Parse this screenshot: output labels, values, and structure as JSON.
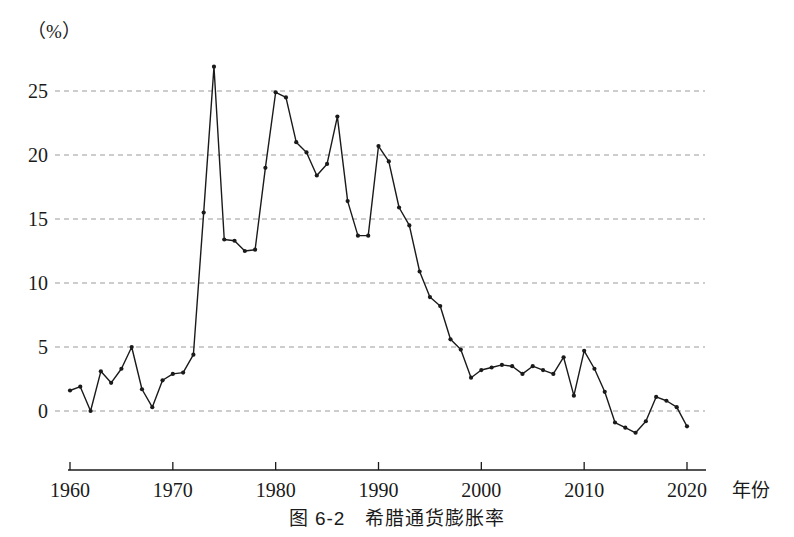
{
  "caption": "图 6-2　希腊通货膨胀率",
  "chart_data": {
    "type": "line",
    "title": "图 6-2　希腊通货膨胀率",
    "subtitle": "",
    "xlabel": "年份",
    "ylabel": "（%）",
    "unit_label": "（%）",
    "xlim": [
      1959,
      2021
    ],
    "ylim": [
      -2.5,
      28
    ],
    "grid": true,
    "grid_axis": "y",
    "legend": false,
    "legend_position": "none",
    "marker": "dot",
    "line_color": "#1a1a1a",
    "grid_color": "#9a9a9a",
    "axis_color": "#1a1a1a",
    "y_ticks": [
      0,
      5,
      10,
      15,
      20,
      25
    ],
    "y_tick_labels": [
      "0",
      "5",
      "10",
      "15",
      "20",
      "25"
    ],
    "x_ticks": [
      1960,
      1970,
      1980,
      1990,
      2000,
      2010,
      2020
    ],
    "x_tick_labels": [
      "1960",
      "1970",
      "1980",
      "1990",
      "2000",
      "2010",
      "2020"
    ],
    "x": [
      1960,
      1961,
      1962,
      1963,
      1964,
      1965,
      1966,
      1967,
      1968,
      1969,
      1970,
      1971,
      1972,
      1973,
      1974,
      1975,
      1976,
      1977,
      1978,
      1979,
      1980,
      1981,
      1982,
      1983,
      1984,
      1985,
      1986,
      1987,
      1988,
      1989,
      1990,
      1991,
      1992,
      1993,
      1994,
      1995,
      1996,
      1997,
      1998,
      1999,
      2000,
      2001,
      2002,
      2003,
      2004,
      2005,
      2006,
      2007,
      2008,
      2009,
      2010,
      2011,
      2012,
      2013,
      2014,
      2015,
      2016,
      2017,
      2018,
      2019,
      2020
    ],
    "values": [
      1.6,
      1.9,
      0.0,
      3.1,
      2.2,
      3.3,
      5.0,
      1.7,
      0.3,
      2.4,
      2.9,
      3.0,
      4.4,
      15.5,
      26.9,
      13.4,
      13.3,
      12.5,
      12.6,
      19.0,
      24.9,
      24.5,
      21.0,
      20.2,
      18.4,
      19.3,
      23.0,
      16.4,
      13.7,
      13.7,
      20.7,
      19.5,
      15.9,
      14.5,
      10.9,
      8.9,
      8.2,
      5.6,
      4.8,
      2.6,
      3.2,
      3.4,
      3.6,
      3.5,
      2.9,
      3.5,
      3.2,
      2.9,
      4.2,
      1.2,
      4.7,
      3.3,
      1.5,
      -0.9,
      -1.3,
      -1.7,
      -0.8,
      1.1,
      0.8,
      0.3,
      -1.2
    ],
    "series_name": "Greece inflation rate",
    "peak": {
      "year": 1974,
      "value": 26.9
    },
    "min": {
      "year": 2015,
      "value": -1.7
    }
  }
}
